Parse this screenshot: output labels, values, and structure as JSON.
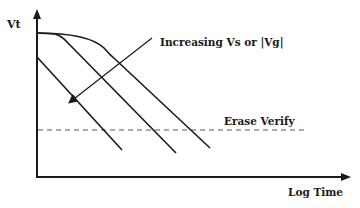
{
  "diagram": {
    "y_axis_label": "Vt",
    "x_axis_label": "Log Time",
    "arrow_annotation": "Increasing Vs or |Vg|",
    "reference_line_label": "Erase Verify",
    "curve_count": 3,
    "colors": {
      "line": "#1a1a1a",
      "dashed": "#555555",
      "background": "#ffffff"
    }
  }
}
